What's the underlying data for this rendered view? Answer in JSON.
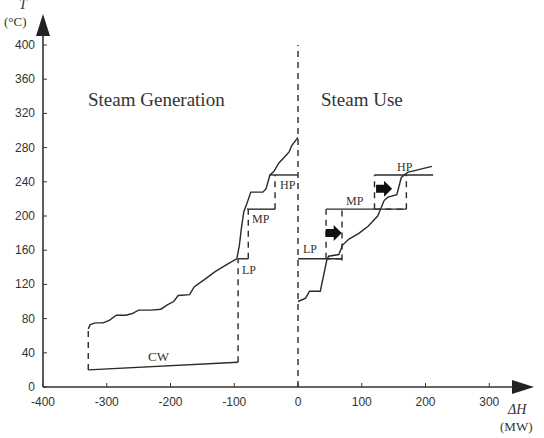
{
  "chart_data": {
    "type": "line",
    "title": "",
    "xlabel": "ΔH",
    "xlabel_unit": "(MW)",
    "ylabel": "T",
    "ylabel_unit": "(°C)",
    "xlim": [
      -400,
      340
    ],
    "ylim": [
      0,
      420
    ],
    "x_ticks": [
      -400,
      -300,
      -200,
      -100,
      0,
      100,
      200,
      300
    ],
    "y_ticks": [
      0,
      40,
      80,
      120,
      160,
      200,
      240,
      280,
      320,
      360,
      400
    ],
    "grid": false,
    "annotations": {
      "left_region": "Steam Generation",
      "right_region": "Steam Use",
      "gen_levels": [
        "LP",
        "MP",
        "HP"
      ],
      "use_levels": [
        "LP",
        "MP",
        "HP"
      ],
      "cw_label": "CW"
    },
    "series": [
      {
        "name": "Cooling water (CW)",
        "points": [
          [
            -329,
            20
          ],
          [
            -94,
            29
          ]
        ]
      },
      {
        "name": "Steam generation curve",
        "points": [
          [
            -329,
            68
          ],
          [
            -326,
            73
          ],
          [
            -318,
            75
          ],
          [
            -306,
            75
          ],
          [
            -296,
            78
          ],
          [
            -285,
            84
          ],
          [
            -270,
            84
          ],
          [
            -260,
            86
          ],
          [
            -250,
            90
          ],
          [
            -230,
            90
          ],
          [
            -215,
            91
          ],
          [
            -205,
            96
          ],
          [
            -195,
            100
          ],
          [
            -188,
            107
          ],
          [
            -170,
            108
          ],
          [
            -163,
            117
          ],
          [
            -148,
            125
          ],
          [
            -130,
            135
          ],
          [
            -110,
            144
          ],
          [
            -96,
            150
          ],
          [
            -92,
            165
          ],
          [
            -89,
            185
          ],
          [
            -85,
            205
          ],
          [
            -80,
            215
          ],
          [
            -74,
            228
          ],
          [
            -55,
            228
          ],
          [
            -50,
            232
          ],
          [
            -44,
            248
          ],
          [
            -38,
            252
          ],
          [
            -30,
            262
          ],
          [
            -20,
            270
          ],
          [
            -14,
            275
          ],
          [
            -10,
            282
          ],
          [
            0,
            292
          ]
        ]
      },
      {
        "name": "Steam use curve",
        "points": [
          [
            0,
            100
          ],
          [
            12,
            104
          ],
          [
            18,
            112
          ],
          [
            35,
            112
          ],
          [
            45,
            148
          ],
          [
            48,
            153
          ],
          [
            64,
            155
          ],
          [
            70,
            166
          ],
          [
            80,
            173
          ],
          [
            96,
            180
          ],
          [
            110,
            188
          ],
          [
            125,
            200
          ],
          [
            135,
            218
          ],
          [
            141,
            222
          ],
          [
            155,
            225
          ],
          [
            162,
            245
          ],
          [
            172,
            251
          ],
          [
            210,
            258
          ]
        ]
      }
    ],
    "levels": {
      "generation": [
        {
          "label": "LP",
          "T": 150,
          "x_from": -94,
          "x_to": -78
        },
        {
          "label": "MP",
          "T": 208,
          "x_from": -80,
          "x_to": -36
        },
        {
          "label": "HP",
          "T": 248,
          "x_from": -44,
          "x_to": 0
        }
      ],
      "use": [
        {
          "label": "LP",
          "T": 150,
          "x_from": 0,
          "x_to": 69
        },
        {
          "label": "MP",
          "T": 208,
          "x_from": 44,
          "x_to": 170
        },
        {
          "label": "HP",
          "T": 248,
          "x_from": 120,
          "x_to": 212
        }
      ],
      "dashed_boundaries": [
        {
          "x": -329,
          "T_from": 20,
          "T_to": 68
        },
        {
          "x": -94,
          "T_from": 29,
          "T_to": 150
        },
        {
          "x": -78,
          "T_from": 150,
          "T_to": 208
        },
        {
          "x": -36,
          "T_from": 208,
          "T_to": 248
        },
        {
          "x": 0,
          "T_from": 0,
          "T_to": 400
        }
      ],
      "arrows": [
        {
          "x": 56,
          "T": 180,
          "direction": "right"
        },
        {
          "x": 135,
          "T": 232,
          "direction": "right"
        }
      ]
    }
  },
  "labels": {
    "y_axis_symbol": "T",
    "y_axis_unit": "(°C)",
    "x_axis_symbol": "ΔH",
    "x_axis_unit": "(MW)",
    "steam_generation": "Steam Generation",
    "steam_use": "Steam Use",
    "cw": "CW",
    "lp": "LP",
    "mp": "MP",
    "hp": "HP"
  }
}
